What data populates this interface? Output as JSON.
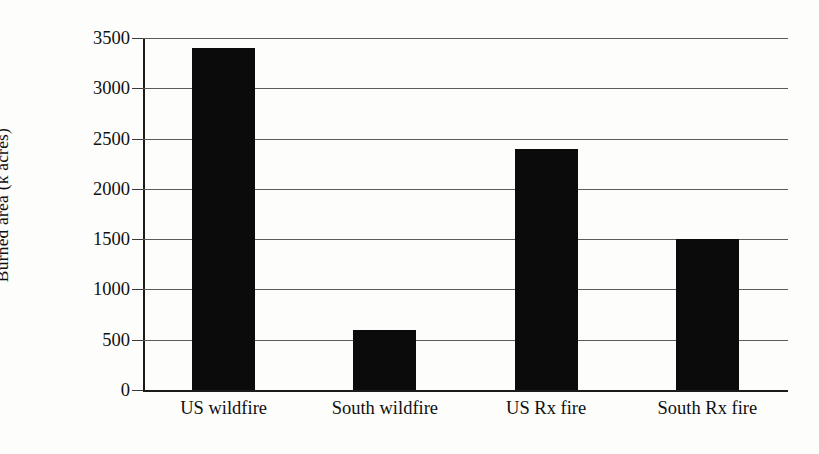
{
  "chart_data": {
    "type": "bar",
    "title": "",
    "xlabel": "",
    "ylabel": "Burned area (k acres)",
    "categories": [
      "US wildfire",
      "South wildfire",
      "US Rx fire",
      "South Rx fire"
    ],
    "values": [
      3400,
      600,
      2400,
      1500
    ],
    "ylim": [
      0,
      3500
    ],
    "ytick_labels": [
      "0",
      "500",
      "1000",
      "1500",
      "2000",
      "2500",
      "3000",
      "3500"
    ],
    "ytick_values": [
      0,
      500,
      1000,
      1500,
      2000,
      2500,
      3000,
      3500
    ],
    "grid": true,
    "legend": "none",
    "bar_color": "#0b0b0b",
    "gridline_color": "#5c5c5c",
    "axis_color": "#1b1b1b",
    "background_color": "#ffffff"
  }
}
